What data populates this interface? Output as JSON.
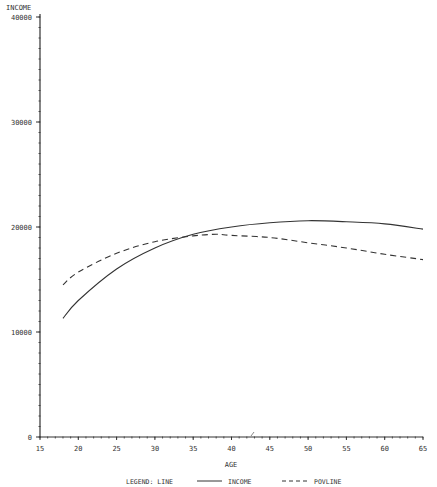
{
  "chart_data": {
    "type": "line",
    "title": "",
    "xlabel": "AGE",
    "ylabel": "INCOME",
    "xlim": [
      15,
      65
    ],
    "ylim": [
      0,
      40000
    ],
    "x_ticks": [
      "15",
      "20",
      "25",
      "30",
      "35",
      "40",
      "45",
      "50",
      "55",
      "60",
      "65"
    ],
    "y_ticks": [
      "0",
      "10000",
      "20000",
      "30000",
      "40000"
    ],
    "grid": false,
    "legend": {
      "title": "LEGEND: LINE",
      "position": "bottom",
      "entries": [
        {
          "label": "INCOME",
          "style": "solid"
        },
        {
          "label": "POVLINE",
          "style": "dashed"
        }
      ]
    },
    "series": [
      {
        "name": "INCOME",
        "style": "solid",
        "x": [
          18,
          20,
          25,
          30,
          35,
          40,
          45,
          50,
          55,
          60,
          65
        ],
        "values": [
          11300,
          13000,
          16000,
          18000,
          19300,
          20000,
          20400,
          20600,
          20500,
          20300,
          19800
        ]
      },
      {
        "name": "POVLINE",
        "style": "dashed",
        "x": [
          18,
          20,
          25,
          30,
          35,
          38,
          40,
          45,
          50,
          55,
          60,
          65
        ],
        "values": [
          14500,
          15700,
          17500,
          18600,
          19150,
          19300,
          19200,
          19000,
          18500,
          18000,
          17400,
          16900
        ]
      }
    ]
  }
}
